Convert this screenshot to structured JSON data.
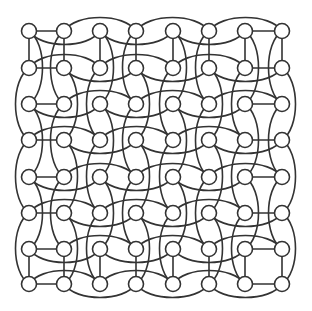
{
  "diagram": {
    "type": "graph",
    "rows": 8,
    "cols": 8,
    "col_x": [
      29,
      64,
      100,
      136,
      173,
      209,
      245,
      282
    ],
    "row_y": [
      31,
      68,
      104,
      140,
      177,
      213,
      249,
      284
    ],
    "node_radius": 7.5,
    "arc_offset": 9,
    "colors": {
      "stroke": "#333333",
      "node_fill": "#ffffff",
      "background": "#ffffff"
    },
    "straight_edges": {
      "vertical_row_pairs": [
        [
          0,
          1
        ],
        [
          6,
          7
        ]
      ],
      "horizontal_col_pairs": [
        [
          0,
          1
        ],
        [
          6,
          7
        ]
      ]
    },
    "skip_edges": {
      "step": 2,
      "alternate_sides": true
    }
  }
}
